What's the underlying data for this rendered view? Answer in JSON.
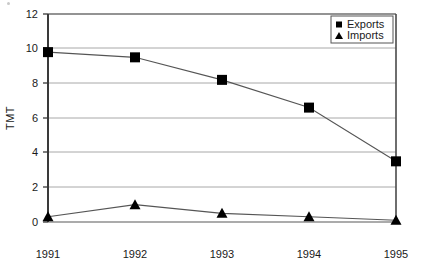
{
  "chart_data": {
    "type": "line",
    "title": "",
    "xlabel": "",
    "ylabel": "TMT",
    "categories": [
      "1991",
      "1992",
      "1993",
      "1994",
      "1995"
    ],
    "x": [
      1991,
      1992,
      1993,
      1994,
      1995
    ],
    "series": [
      {
        "name": "Exports",
        "marker": "square",
        "color": "#000000",
        "values": [
          9.8,
          9.5,
          8.2,
          6.6,
          3.5
        ]
      },
      {
        "name": "Imports",
        "marker": "triangle",
        "color": "#000000",
        "values": [
          0.3,
          1.0,
          0.5,
          0.3,
          0.1
        ]
      }
    ],
    "ylim": [
      0,
      12
    ],
    "yticks": [
      0,
      2,
      4,
      6,
      8,
      10,
      12
    ],
    "ytick_labels": [
      "0",
      "2",
      "4",
      "6",
      "8",
      "10",
      "12"
    ],
    "xtick_labels": [
      "1991",
      "1992",
      "1993",
      "1994",
      "1995"
    ],
    "grid": "horizontal",
    "legend_position": "top-right",
    "legend_entries": [
      {
        "label": "Exports",
        "marker": "square"
      },
      {
        "label": "Imports",
        "marker": "triangle"
      }
    ],
    "colors": {
      "axis": "#3a3a3a",
      "gridline": "#a8a8a8",
      "series_line": "#555555",
      "marker": "#000000",
      "text": "#1a1a1a",
      "frame": "#8a8a8a",
      "background": "#ffffff"
    }
  },
  "axis": {
    "y_title": "TMT",
    "y_labels": {
      "t0": "0",
      "t2": "2",
      "t4": "4",
      "t6": "6",
      "t8": "8",
      "t10": "10",
      "t12": "12"
    },
    "x_labels": {
      "x1991": "1991",
      "x1992": "1992",
      "x1993": "1993",
      "x1994": "1994",
      "x1995": "1995"
    }
  },
  "legend": {
    "exports_label": "Exports",
    "imports_label": "Imports"
  }
}
